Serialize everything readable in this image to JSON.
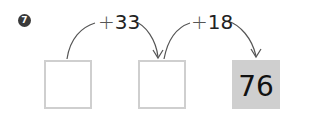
{
  "problem": {
    "number": "7",
    "steps": [
      {
        "operator": "+",
        "operand": "33"
      },
      {
        "operator": "+",
        "operand": "18"
      }
    ],
    "boxes": [
      {
        "value": "",
        "filled": false
      },
      {
        "value": "",
        "filled": false
      },
      {
        "value": "76",
        "filled": true
      }
    ]
  },
  "colors": {
    "box_border": "#cfcfcf",
    "box_fill": "#cfcfcf",
    "arrow": "#555555",
    "badge": "#3a3a3a"
  }
}
